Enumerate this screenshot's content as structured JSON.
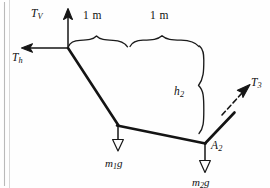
{
  "figure": {
    "background_color": "#fefefe",
    "ink_color": "#141414",
    "width": 270,
    "height": 188
  },
  "labels": {
    "tension_vertical": "T",
    "tension_vertical_sub": "V",
    "tension_horizontal": "T",
    "tension_horizontal_sub": "h",
    "tension_three": "T",
    "tension_three_sub": "3",
    "span_one": "1 m",
    "span_two": "1 m",
    "height_two": "h",
    "height_two_sub": "2",
    "joint_two": "A",
    "joint_two_sub": "2",
    "weight_one": "m",
    "weight_one_sub": "1",
    "weight_one_tail": "g",
    "weight_two": "m",
    "weight_two_sub": "2",
    "weight_two_tail": "g"
  },
  "geometry": {
    "anchor_left": [
      68,
      48
    ],
    "joint_one": [
      118,
      125
    ],
    "joint_two": [
      205,
      143
    ],
    "cable_end_right": [
      234,
      113
    ],
    "tv_arrow_tip": [
      68,
      9
    ],
    "th_arrow_tip": [
      22,
      48
    ],
    "t3_arrow_tip": [
      250,
      84
    ],
    "m1g_arrow_tip": [
      118,
      150
    ],
    "m2g_arrow_tip": [
      205,
      172
    ],
    "brace_one_span": [
      68,
      128
    ],
    "brace_two_span": [
      130,
      200
    ],
    "brace_h2_span": [
      46,
      140
    ]
  }
}
